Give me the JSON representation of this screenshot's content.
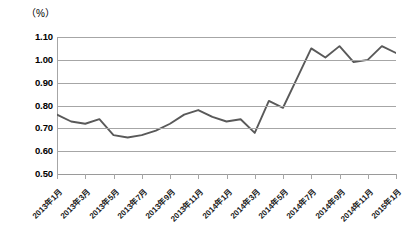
{
  "chart_data": {
    "type": "line",
    "title": "",
    "subtitle": "",
    "xlabel": "",
    "ylabel": "",
    "unit_label": "（%）",
    "ylim": [
      0.5,
      1.1
    ],
    "ytick_values": [
      1.1,
      1.0,
      0.9,
      0.8,
      0.7,
      0.6,
      0.5
    ],
    "ytick_labels": [
      "1.10",
      "1.00",
      "0.90",
      "0.80",
      "0.70",
      "0.60",
      "0.50"
    ],
    "grid": true,
    "legend": "none",
    "x": [
      "2013年1月",
      "2013年2月",
      "2013年3月",
      "2013年4月",
      "2013年5月",
      "2013年6月",
      "2013年7月",
      "2013年8月",
      "2013年9月",
      "2013年10月",
      "2013年11月",
      "2013年12月",
      "2014年1月",
      "2014年2月",
      "2014年3月",
      "2014年4月",
      "2014年5月",
      "2014年6月",
      "2014年7月",
      "2014年8月",
      "2014年9月",
      "2014年10月",
      "2014年11月",
      "2014年12月",
      "2015年1月"
    ],
    "xtick_labels": [
      "2013年1月",
      "2013年3月",
      "2013年5月",
      "2013年7月",
      "2013年9月",
      "2013年11月",
      "2014年1月",
      "2014年3月",
      "2014年5月",
      "2014年7月",
      "2014年9月",
      "2014年11月",
      "2015年1月"
    ],
    "values": [
      0.76,
      0.73,
      0.72,
      0.74,
      0.67,
      0.66,
      0.67,
      0.69,
      0.72,
      0.76,
      0.78,
      0.75,
      0.73,
      0.74,
      0.68,
      0.82,
      0.79,
      0.92,
      1.05,
      1.01,
      1.06,
      0.99,
      1.0,
      1.06,
      1.03
    ],
    "series_color": "#595959",
    "grid_color": "#a6a6a6"
  }
}
